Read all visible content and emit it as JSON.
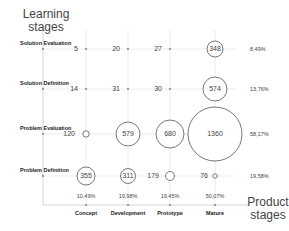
{
  "chart_data": {
    "type": "bubble",
    "title": "",
    "xlabel": "Product stages",
    "ylabel": "Learning stages",
    "x_categories": [
      "Concept",
      "Development",
      "Prototype",
      "Mature"
    ],
    "y_categories": [
      "Solution Evaluation",
      "Solution Definition",
      "Problem Evaluation",
      "Problem Definition"
    ],
    "x_totals_pct": [
      "10,49%",
      "19,98%",
      "19,45%",
      "50,07%"
    ],
    "y_totals_pct": [
      "8,49%",
      "13,76%",
      "58,17%",
      "19,58%"
    ],
    "values": [
      {
        "row": "Solution Evaluation",
        "values": [
          5,
          20,
          27,
          348
        ]
      },
      {
        "row": "Solution Definition",
        "values": [
          14,
          31,
          30,
          574
        ]
      },
      {
        "row": "Problem Evaluation",
        "values": [
          120,
          579,
          680,
          1360
        ]
      },
      {
        "row": "Problem Definition",
        "values": [
          355,
          311,
          179,
          76
        ]
      }
    ],
    "circled_cells": [
      {
        "row": 0,
        "col": 3,
        "value": 348,
        "label_inside": true
      },
      {
        "row": 1,
        "col": 3,
        "value": 574,
        "label_inside": true
      },
      {
        "row": 2,
        "col": 0,
        "value": 120,
        "label_inside": false
      },
      {
        "row": 2,
        "col": 1,
        "value": 579,
        "label_inside": true
      },
      {
        "row": 2,
        "col": 2,
        "value": 680,
        "label_inside": true
      },
      {
        "row": 2,
        "col": 3,
        "value": 1360,
        "label_inside": true
      },
      {
        "row": 3,
        "col": 0,
        "value": 355,
        "label_inside": true
      },
      {
        "row": 3,
        "col": 1,
        "value": 311,
        "label_inside": true
      },
      {
        "row": 3,
        "col": 2,
        "value": 179,
        "label_inside": false
      },
      {
        "row": 3,
        "col": 3,
        "value": 76,
        "label_inside": false
      }
    ],
    "grid": true,
    "legend": "none"
  },
  "labels": {
    "y_title_line1": "Learning",
    "y_title_line2": "stages",
    "x_title_line1": "Product",
    "x_title_line2": "stages"
  },
  "colors": {
    "circle_stroke": "#555555",
    "grid": "#dddddd",
    "axis": "#bbbbbb"
  }
}
